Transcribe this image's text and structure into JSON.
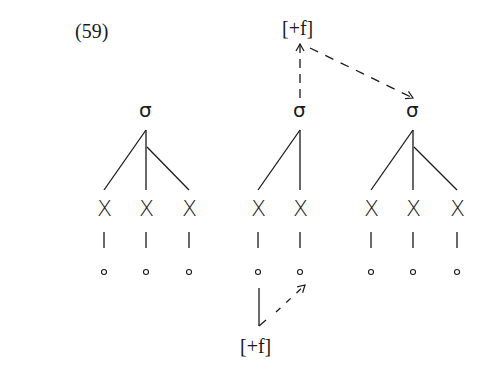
{
  "example_number": "(59)",
  "feature_top": "[+f]",
  "feature_bottom": "[+f]",
  "syllables": [
    {
      "label": "σ",
      "x": 146,
      "segments": [
        {
          "label": "X",
          "x": 104
        },
        {
          "label": "X",
          "x": 146
        },
        {
          "label": "X",
          "x": 189
        }
      ]
    },
    {
      "label": "σ",
      "x": 300,
      "segments": [
        {
          "label": "X",
          "x": 258
        },
        {
          "label": "X",
          "x": 300
        }
      ]
    },
    {
      "label": "σ",
      "x": 413,
      "segments": [
        {
          "label": "X",
          "x": 371
        },
        {
          "label": "X",
          "x": 413
        },
        {
          "label": "X",
          "x": 457
        }
      ]
    }
  ],
  "timing_slot_symbol": "∘",
  "arrows": [
    {
      "from": "syllable-2",
      "to": "feature-top",
      "style": "dashed"
    },
    {
      "from": "feature-top",
      "to": "syllable-3",
      "style": "dashed"
    },
    {
      "from": "timing-slot-2-1",
      "to": "feature-bottom",
      "style": "solid"
    },
    {
      "from": "feature-bottom",
      "to": "timing-slot-2-2",
      "style": "dashed"
    }
  ]
}
